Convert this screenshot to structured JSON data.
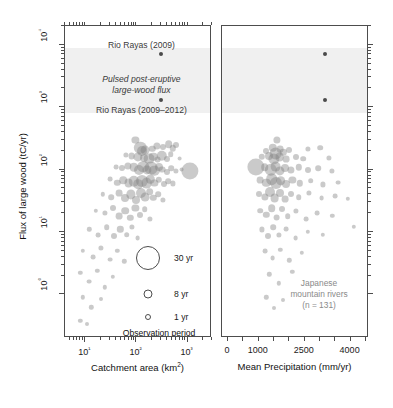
{
  "figure": {
    "background": "#ffffff",
    "bubble_color": "#808080",
    "outlier_color": "#4a4a4a",
    "band_color": "#f0f0f0",
    "axis_color": "#4d4d4d"
  },
  "chart_data": {
    "type": "scatter",
    "title": "",
    "ylabel": "Flux of large wood (tC/yr)",
    "ylim": [
      0.2,
      20000
    ],
    "yscale": "log",
    "yticks": [
      "10⁰",
      "10¹",
      "10²",
      "10³",
      "10⁴"
    ],
    "grid": false,
    "legend_position": "inside-lower-right-left-panel",
    "size_encoding": "Observation period (yr)",
    "panels": [
      {
        "name": "catchment-area",
        "xlabel": "Catchment area (km²)",
        "xscale": "log",
        "xlim": [
          4,
          3000
        ],
        "xticks": [
          "10¹",
          "10²",
          "10³"
        ],
        "points": [
          {
            "x": 300,
            "y": 7000,
            "r": 2.0,
            "outlier": true
          },
          {
            "x": 300,
            "y": 1300,
            "r": 2.0,
            "outlier": true
          },
          {
            "x": 95,
            "y": 300,
            "r": 3.6
          },
          {
            "x": 118,
            "y": 225,
            "r": 6.2
          },
          {
            "x": 128,
            "y": 200,
            "r": 5.0
          },
          {
            "x": 150,
            "y": 205,
            "r": 4.4
          },
          {
            "x": 205,
            "y": 215,
            "r": 3.2
          },
          {
            "x": 250,
            "y": 240,
            "r": 3.6
          },
          {
            "x": 330,
            "y": 230,
            "r": 3.0
          },
          {
            "x": 430,
            "y": 255,
            "r": 3.8
          },
          {
            "x": 520,
            "y": 220,
            "r": 3.2
          },
          {
            "x": 600,
            "y": 245,
            "r": 3.0
          },
          {
            "x": 62,
            "y": 170,
            "r": 2.6
          },
          {
            "x": 80,
            "y": 165,
            "r": 3.4
          },
          {
            "x": 105,
            "y": 160,
            "r": 4.6
          },
          {
            "x": 140,
            "y": 155,
            "r": 4.0
          },
          {
            "x": 175,
            "y": 150,
            "r": 5.4
          },
          {
            "x": 215,
            "y": 160,
            "r": 4.2
          },
          {
            "x": 260,
            "y": 145,
            "r": 3.4
          },
          {
            "x": 310,
            "y": 165,
            "r": 5.2
          },
          {
            "x": 395,
            "y": 150,
            "r": 3.0
          },
          {
            "x": 470,
            "y": 175,
            "r": 2.8
          },
          {
            "x": 700,
            "y": 150,
            "r": 2.4
          },
          {
            "x": 40,
            "y": 110,
            "r": 2.4
          },
          {
            "x": 52,
            "y": 105,
            "r": 3.0
          },
          {
            "x": 68,
            "y": 115,
            "r": 3.6
          },
          {
            "x": 88,
            "y": 108,
            "r": 4.2
          },
          {
            "x": 110,
            "y": 100,
            "r": 5.0
          },
          {
            "x": 135,
            "y": 112,
            "r": 5.8
          },
          {
            "x": 160,
            "y": 98,
            "r": 4.6
          },
          {
            "x": 190,
            "y": 105,
            "r": 6.4
          },
          {
            "x": 225,
            "y": 95,
            "r": 5.2
          },
          {
            "x": 270,
            "y": 110,
            "r": 4.0
          },
          {
            "x": 320,
            "y": 100,
            "r": 3.4
          },
          {
            "x": 400,
            "y": 92,
            "r": 3.0
          },
          {
            "x": 480,
            "y": 105,
            "r": 2.8
          },
          {
            "x": 580,
            "y": 95,
            "r": 2.6
          },
          {
            "x": 760,
            "y": 100,
            "r": 2.4
          },
          {
            "x": 1100,
            "y": 95,
            "r": 8.6
          },
          {
            "x": 30,
            "y": 70,
            "r": 2.4
          },
          {
            "x": 42,
            "y": 62,
            "r": 3.2
          },
          {
            "x": 55,
            "y": 68,
            "r": 3.8
          },
          {
            "x": 70,
            "y": 60,
            "r": 4.4
          },
          {
            "x": 88,
            "y": 65,
            "r": 5.2
          },
          {
            "x": 108,
            "y": 58,
            "r": 4.8
          },
          {
            "x": 130,
            "y": 66,
            "r": 6.0
          },
          {
            "x": 158,
            "y": 60,
            "r": 5.4
          },
          {
            "x": 188,
            "y": 70,
            "r": 4.2
          },
          {
            "x": 225,
            "y": 62,
            "r": 3.6
          },
          {
            "x": 275,
            "y": 68,
            "r": 3.2
          },
          {
            "x": 340,
            "y": 58,
            "r": 3.0
          },
          {
            "x": 420,
            "y": 65,
            "r": 2.8
          },
          {
            "x": 520,
            "y": 60,
            "r": 2.6
          },
          {
            "x": 22,
            "y": 40,
            "r": 2.2
          },
          {
            "x": 32,
            "y": 36,
            "r": 2.8
          },
          {
            "x": 45,
            "y": 42,
            "r": 3.4
          },
          {
            "x": 60,
            "y": 35,
            "r": 4.0
          },
          {
            "x": 78,
            "y": 40,
            "r": 4.6
          },
          {
            "x": 98,
            "y": 33,
            "r": 4.0
          },
          {
            "x": 120,
            "y": 42,
            "r": 5.0
          },
          {
            "x": 148,
            "y": 36,
            "r": 4.4
          },
          {
            "x": 180,
            "y": 44,
            "r": 3.8
          },
          {
            "x": 215,
            "y": 35,
            "r": 3.2
          },
          {
            "x": 265,
            "y": 40,
            "r": 2.8
          },
          {
            "x": 325,
            "y": 33,
            "r": 2.6
          },
          {
            "x": 16,
            "y": 22,
            "r": 2.2
          },
          {
            "x": 24,
            "y": 20,
            "r": 2.6
          },
          {
            "x": 34,
            "y": 24,
            "r": 3.0
          },
          {
            "x": 46,
            "y": 18,
            "r": 3.4
          },
          {
            "x": 60,
            "y": 22,
            "r": 3.8
          },
          {
            "x": 76,
            "y": 17,
            "r": 3.2
          },
          {
            "x": 95,
            "y": 24,
            "r": 3.6
          },
          {
            "x": 118,
            "y": 19,
            "r": 3.0
          },
          {
            "x": 145,
            "y": 23,
            "r": 2.8
          },
          {
            "x": 180,
            "y": 16,
            "r": 2.6
          },
          {
            "x": 12,
            "y": 11,
            "r": 2.2
          },
          {
            "x": 18,
            "y": 9,
            "r": 2.4
          },
          {
            "x": 26,
            "y": 12,
            "r": 2.8
          },
          {
            "x": 36,
            "y": 8.5,
            "r": 3.0
          },
          {
            "x": 48,
            "y": 11,
            "r": 3.2
          },
          {
            "x": 64,
            "y": 9,
            "r": 2.8
          },
          {
            "x": 82,
            "y": 12,
            "r": 2.6
          },
          {
            "x": 105,
            "y": 8,
            "r": 2.4
          },
          {
            "x": 9,
            "y": 5,
            "r": 2.2
          },
          {
            "x": 14,
            "y": 4,
            "r": 2.4
          },
          {
            "x": 20,
            "y": 5.5,
            "r": 2.6
          },
          {
            "x": 30,
            "y": 3.6,
            "r": 2.4
          },
          {
            "x": 42,
            "y": 5,
            "r": 2.2
          },
          {
            "x": 58,
            "y": 3.4,
            "r": 2.2
          },
          {
            "x": 8,
            "y": 2.2,
            "r": 2.2
          },
          {
            "x": 12,
            "y": 1.6,
            "r": 2.4
          },
          {
            "x": 17,
            "y": 2.4,
            "r": 2.2
          },
          {
            "x": 24,
            "y": 1.3,
            "r": 2.2
          },
          {
            "x": 34,
            "y": 1.9,
            "r": 2.2
          },
          {
            "x": 9,
            "y": 0.9,
            "r": 2.2
          },
          {
            "x": 13,
            "y": 0.62,
            "r": 2.2
          },
          {
            "x": 20,
            "y": 0.85,
            "r": 2.0
          },
          {
            "x": 8,
            "y": 0.38,
            "r": 2.2
          },
          {
            "x": 11,
            "y": 0.33,
            "r": 2.0
          }
        ]
      },
      {
        "name": "mean-precipitation",
        "xlabel": "Mean Precipitation (mm/yr)",
        "xscale": "linear",
        "xlim": [
          -200,
          4600
        ],
        "xticks": [
          "0",
          "1000",
          "2500",
          "4000"
        ],
        "xtickvals": [
          0,
          1000,
          2500,
          4000
        ],
        "points": [
          {
            "x": 3150,
            "y": 7000,
            "r": 2.0,
            "outlier": true
          },
          {
            "x": 3150,
            "y": 1300,
            "r": 2.0,
            "outlier": true
          },
          {
            "x": 1600,
            "y": 300,
            "r": 3.6
          },
          {
            "x": 1450,
            "y": 225,
            "r": 4.2
          },
          {
            "x": 1700,
            "y": 215,
            "r": 3.4
          },
          {
            "x": 1250,
            "y": 200,
            "r": 3.0
          },
          {
            "x": 1550,
            "y": 180,
            "r": 6.4
          },
          {
            "x": 1800,
            "y": 190,
            "r": 3.2
          },
          {
            "x": 2000,
            "y": 205,
            "r": 3.0
          },
          {
            "x": 2600,
            "y": 215,
            "r": 2.6
          },
          {
            "x": 3000,
            "y": 225,
            "r": 2.8
          },
          {
            "x": 1100,
            "y": 160,
            "r": 3.2
          },
          {
            "x": 1350,
            "y": 165,
            "r": 4.0
          },
          {
            "x": 1500,
            "y": 150,
            "r": 5.6
          },
          {
            "x": 1680,
            "y": 158,
            "r": 4.4
          },
          {
            "x": 1900,
            "y": 148,
            "r": 3.4
          },
          {
            "x": 2200,
            "y": 162,
            "r": 3.0
          },
          {
            "x": 2450,
            "y": 150,
            "r": 2.8
          },
          {
            "x": 3300,
            "y": 155,
            "r": 2.6
          },
          {
            "x": 900,
            "y": 110,
            "r": 8.6
          },
          {
            "x": 1200,
            "y": 108,
            "r": 3.8
          },
          {
            "x": 1400,
            "y": 100,
            "r": 6.2
          },
          {
            "x": 1550,
            "y": 112,
            "r": 5.4
          },
          {
            "x": 1700,
            "y": 96,
            "r": 4.6
          },
          {
            "x": 1850,
            "y": 105,
            "r": 4.0
          },
          {
            "x": 2050,
            "y": 98,
            "r": 3.6
          },
          {
            "x": 2300,
            "y": 108,
            "r": 3.2
          },
          {
            "x": 2600,
            "y": 100,
            "r": 3.0
          },
          {
            "x": 2950,
            "y": 105,
            "r": 2.8
          },
          {
            "x": 3400,
            "y": 95,
            "r": 2.6
          },
          {
            "x": 1050,
            "y": 68,
            "r": 3.4
          },
          {
            "x": 1250,
            "y": 62,
            "r": 4.2
          },
          {
            "x": 1420,
            "y": 70,
            "r": 5.8
          },
          {
            "x": 1560,
            "y": 60,
            "r": 6.0
          },
          {
            "x": 1720,
            "y": 66,
            "r": 4.8
          },
          {
            "x": 1880,
            "y": 58,
            "r": 4.0
          },
          {
            "x": 2100,
            "y": 68,
            "r": 3.6
          },
          {
            "x": 2350,
            "y": 60,
            "r": 3.2
          },
          {
            "x": 2700,
            "y": 66,
            "r": 2.8
          },
          {
            "x": 3100,
            "y": 58,
            "r": 2.6
          },
          {
            "x": 3600,
            "y": 62,
            "r": 2.4
          },
          {
            "x": 1000,
            "y": 40,
            "r": 3.0
          },
          {
            "x": 1200,
            "y": 36,
            "r": 3.6
          },
          {
            "x": 1380,
            "y": 43,
            "r": 5.0
          },
          {
            "x": 1520,
            "y": 35,
            "r": 4.4
          },
          {
            "x": 1680,
            "y": 42,
            "r": 4.0
          },
          {
            "x": 1850,
            "y": 34,
            "r": 3.4
          },
          {
            "x": 2050,
            "y": 40,
            "r": 3.0
          },
          {
            "x": 2300,
            "y": 36,
            "r": 2.8
          },
          {
            "x": 2650,
            "y": 42,
            "r": 2.6
          },
          {
            "x": 3050,
            "y": 35,
            "r": 2.4
          },
          {
            "x": 3500,
            "y": 38,
            "r": 2.4
          },
          {
            "x": 3900,
            "y": 34,
            "r": 2.2
          },
          {
            "x": 1050,
            "y": 22,
            "r": 2.8
          },
          {
            "x": 1250,
            "y": 19,
            "r": 3.2
          },
          {
            "x": 1420,
            "y": 24,
            "r": 3.8
          },
          {
            "x": 1580,
            "y": 17,
            "r": 3.4
          },
          {
            "x": 1750,
            "y": 23,
            "r": 3.0
          },
          {
            "x": 1950,
            "y": 18,
            "r": 2.8
          },
          {
            "x": 2200,
            "y": 22,
            "r": 2.6
          },
          {
            "x": 2550,
            "y": 16,
            "r": 2.4
          },
          {
            "x": 2900,
            "y": 20,
            "r": 2.4
          },
          {
            "x": 3400,
            "y": 18,
            "r": 2.2
          },
          {
            "x": 1100,
            "y": 11,
            "r": 2.6
          },
          {
            "x": 1300,
            "y": 8.5,
            "r": 3.0
          },
          {
            "x": 1480,
            "y": 12,
            "r": 2.8
          },
          {
            "x": 1650,
            "y": 9,
            "r": 2.6
          },
          {
            "x": 1900,
            "y": 11,
            "r": 2.4
          },
          {
            "x": 2200,
            "y": 8,
            "r": 2.4
          },
          {
            "x": 2600,
            "y": 10,
            "r": 2.2
          },
          {
            "x": 3100,
            "y": 9,
            "r": 2.2
          },
          {
            "x": 4100,
            "y": 12,
            "r": 2.2
          },
          {
            "x": 1200,
            "y": 5,
            "r": 2.4
          },
          {
            "x": 1450,
            "y": 3.8,
            "r": 2.4
          },
          {
            "x": 1700,
            "y": 5.2,
            "r": 2.2
          },
          {
            "x": 2000,
            "y": 3.5,
            "r": 2.2
          },
          {
            "x": 2400,
            "y": 4.6,
            "r": 2.2
          },
          {
            "x": 1350,
            "y": 2.1,
            "r": 2.2
          },
          {
            "x": 1650,
            "y": 1.5,
            "r": 2.2
          },
          {
            "x": 2100,
            "y": 2.3,
            "r": 2.2
          },
          {
            "x": 1250,
            "y": 0.9,
            "r": 2.2
          },
          {
            "x": 1500,
            "y": 0.6,
            "r": 2.0
          },
          {
            "x": 1800,
            "y": 0.8,
            "r": 2.0
          }
        ],
        "note_lines": [
          "Japanese",
          "mountain rivers",
          "(n = 131)"
        ]
      }
    ],
    "shaded_band": {
      "label": "Pulsed post-eruptive large-wood flux",
      "y_range": [
        800,
        9000
      ]
    },
    "annotations": [
      {
        "text": "Rio Rayas (2009)",
        "style": "normal"
      },
      {
        "text": "Pulsed post-eruptive",
        "style": "italic"
      },
      {
        "text": "large-wood flux",
        "style": "italic"
      },
      {
        "text": "Rio Rayas (2009–2012)",
        "style": "normal"
      }
    ],
    "legend": {
      "title": "Observation period",
      "entries": [
        {
          "label": "30 yr",
          "diameter": 22
        },
        {
          "label": "8 yr",
          "diameter": 7
        },
        {
          "label": "1 yr",
          "diameter": 4
        }
      ]
    }
  }
}
